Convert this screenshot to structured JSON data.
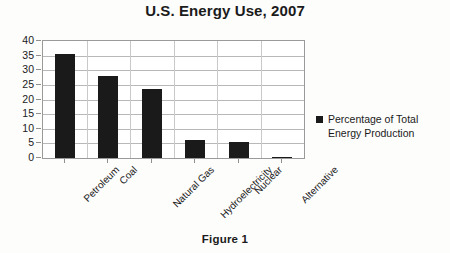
{
  "chart_data": {
    "type": "bar",
    "title": "U.S. Energy Use, 2007",
    "xlabel": "",
    "ylabel": "",
    "categories": [
      "Petroleum",
      "Coal",
      "Natural Gas",
      "Hydroelectricity",
      "Nuclear",
      "Alternative"
    ],
    "values": [
      35.5,
      28,
      23.5,
      6,
      5.5,
      0.5
    ],
    "series": [
      {
        "name": "Percentage of Total Energy Production",
        "values": [
          35.5,
          28,
          23.5,
          6,
          5.5,
          0.5
        ],
        "color": "#1a1a1a"
      }
    ],
    "ylim": [
      0,
      40
    ],
    "yticks": [
      0,
      5,
      10,
      15,
      20,
      25,
      30,
      35,
      40
    ],
    "ytick_labels": [
      "0",
      "5",
      "10",
      "15",
      "20",
      "25",
      "30",
      "35",
      "40"
    ],
    "grid": true,
    "grid_axis": "y",
    "legend_position": "right",
    "legend_entries": [
      "Percentage of Total Energy Production"
    ],
    "bar_color": "#1a1a1a",
    "plot_background": "#ffffff",
    "figure_background": "#fdfdfc"
  },
  "legend": {
    "line1": "Percentage of Total",
    "line2": "Energy Production",
    "swatch_icon": "square-marker-icon"
  },
  "caption": {
    "text": "Figure 1"
  }
}
